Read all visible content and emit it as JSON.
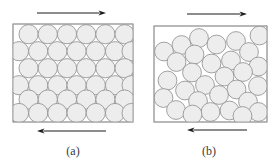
{
  "figure": {
    "background_color": "#ffffff",
    "width": 280,
    "height": 166
  },
  "style": {
    "box_stroke": "#9a9a9a",
    "box_fill": "#ffffff",
    "box_stroke_width": 0.9,
    "circle_fill": "#ededed",
    "circle_stroke": "#8d8d8d",
    "circle_stroke_width": 0.8,
    "arrow_color": "#1a1a1a",
    "arrow_stroke_width": 1.1,
    "caption_color": "#3a3a3a"
  },
  "panels": [
    {
      "id": "a",
      "caption": "(a)",
      "caption_x": 73,
      "caption_y": 152,
      "arrangement": "ordered-hexagonal-close-packed",
      "box": {
        "x": 13,
        "y": 24,
        "width": 120,
        "height": 98
      },
      "circle_radius": 9.6,
      "top_arrow": {
        "name": "shear-arrow-top",
        "direction": "right",
        "x1": 37,
        "x2": 106,
        "y": 13
      },
      "bottom_arrow": {
        "name": "shear-arrow-bottom",
        "direction": "left",
        "x1": 106,
        "x2": 37,
        "y": 131
      },
      "circles": [
        {
          "cx": 28.6,
          "cy": 34.2
        },
        {
          "cx": 47.8,
          "cy": 34.2
        },
        {
          "cx": 67.0,
          "cy": 34.2
        },
        {
          "cx": 86.2,
          "cy": 34.2
        },
        {
          "cx": 105.4,
          "cy": 34.2
        },
        {
          "cx": 124.6,
          "cy": 34.2
        },
        {
          "cx": 19.0,
          "cy": 51.2
        },
        {
          "cx": 38.2,
          "cy": 51.2
        },
        {
          "cx": 57.4,
          "cy": 51.2
        },
        {
          "cx": 76.6,
          "cy": 51.2
        },
        {
          "cx": 95.8,
          "cy": 51.2
        },
        {
          "cx": 115.0,
          "cy": 51.2
        },
        {
          "cx": 131.6,
          "cy": 51.2
        },
        {
          "cx": 28.6,
          "cy": 68.2
        },
        {
          "cx": 47.8,
          "cy": 68.2
        },
        {
          "cx": 67.0,
          "cy": 68.2
        },
        {
          "cx": 86.2,
          "cy": 68.2
        },
        {
          "cx": 105.4,
          "cy": 68.2
        },
        {
          "cx": 124.6,
          "cy": 68.2
        },
        {
          "cx": 19.0,
          "cy": 85.2
        },
        {
          "cx": 38.2,
          "cy": 85.2
        },
        {
          "cx": 57.4,
          "cy": 85.2
        },
        {
          "cx": 76.6,
          "cy": 85.2
        },
        {
          "cx": 95.8,
          "cy": 85.2
        },
        {
          "cx": 115.0,
          "cy": 85.2
        },
        {
          "cx": 131.6,
          "cy": 85.2
        },
        {
          "cx": 28.6,
          "cy": 99.5
        },
        {
          "cx": 47.8,
          "cy": 99.5
        },
        {
          "cx": 67.0,
          "cy": 99.5
        },
        {
          "cx": 86.2,
          "cy": 99.5
        },
        {
          "cx": 105.4,
          "cy": 99.5
        },
        {
          "cx": 124.6,
          "cy": 99.5
        },
        {
          "cx": 19.0,
          "cy": 113.0
        },
        {
          "cx": 38.2,
          "cy": 113.0
        },
        {
          "cx": 57.4,
          "cy": 113.0
        },
        {
          "cx": 76.6,
          "cy": 113.0
        },
        {
          "cx": 95.8,
          "cy": 113.0
        },
        {
          "cx": 115.0,
          "cy": 113.0
        },
        {
          "cx": 131.6,
          "cy": 113.0
        }
      ]
    },
    {
      "id": "b",
      "caption": "(b)",
      "caption_x": 209,
      "caption_y": 152,
      "arrangement": "disordered-random",
      "box": {
        "x": 154,
        "y": 26,
        "width": 113,
        "height": 96
      },
      "circle_radius": 9.4,
      "top_arrow": {
        "name": "shear-arrow-top",
        "direction": "right",
        "x1": 187,
        "x2": 247,
        "y": 14
      },
      "bottom_arrow": {
        "name": "shear-arrow-bottom",
        "direction": "left",
        "x1": 247,
        "x2": 187,
        "y": 130
      },
      "circles": [
        {
          "cx": 181.5,
          "cy": 45.0
        },
        {
          "cx": 199.0,
          "cy": 38.0
        },
        {
          "cx": 216.5,
          "cy": 44.5
        },
        {
          "cx": 236.0,
          "cy": 41.0
        },
        {
          "cx": 259.5,
          "cy": 35.5
        },
        {
          "cx": 164.0,
          "cy": 51.5
        },
        {
          "cx": 194.5,
          "cy": 54.5
        },
        {
          "cx": 249.0,
          "cy": 52.0
        },
        {
          "cx": 176.5,
          "cy": 62.0
        },
        {
          "cx": 211.5,
          "cy": 63.5
        },
        {
          "cx": 231.0,
          "cy": 60.5
        },
        {
          "cx": 258.5,
          "cy": 66.5
        },
        {
          "cx": 192.0,
          "cy": 72.5
        },
        {
          "cx": 224.5,
          "cy": 76.5
        },
        {
          "cx": 243.0,
          "cy": 72.0
        },
        {
          "cx": 167.5,
          "cy": 80.5
        },
        {
          "cx": 205.0,
          "cy": 85.0
        },
        {
          "cx": 185.0,
          "cy": 90.5
        },
        {
          "cx": 236.5,
          "cy": 89.5
        },
        {
          "cx": 258.0,
          "cy": 86.0
        },
        {
          "cx": 219.0,
          "cy": 95.0
        },
        {
          "cx": 163.5,
          "cy": 98.0
        },
        {
          "cx": 198.0,
          "cy": 101.0
        },
        {
          "cx": 248.0,
          "cy": 101.5
        },
        {
          "cx": 176.0,
          "cy": 110.0
        },
        {
          "cx": 210.5,
          "cy": 112.0
        },
        {
          "cx": 229.5,
          "cy": 110.5
        },
        {
          "cx": 192.5,
          "cy": 114.5
        },
        {
          "cx": 258.5,
          "cy": 112.0
        },
        {
          "cx": 242.5,
          "cy": 116.0
        }
      ]
    }
  ]
}
